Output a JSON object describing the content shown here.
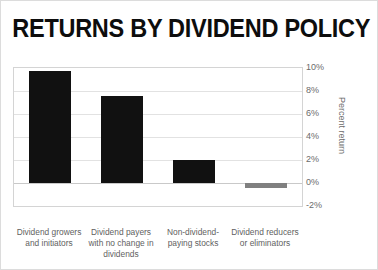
{
  "chart_data": {
    "type": "bar",
    "title": "RETURNS BY DIVIDEND POLICY",
    "xlabel": "",
    "ylabel": "Percent return",
    "categories": [
      "Dividend growers and initiators",
      "Dividend payers with no change in dividends",
      "Non-dividend-paying stocks",
      "Dividend reducers or eliminators"
    ],
    "values": [
      9.7,
      7.6,
      2.0,
      -0.4
    ],
    "value_labels": [
      "9.7%",
      "7.6%",
      "2.0%",
      "-0.4%"
    ],
    "bar_colors": [
      "#111111",
      "#111111",
      "#111111",
      "#808080"
    ],
    "ylim": [
      -2,
      10
    ],
    "yticks": [
      10,
      8,
      6,
      4,
      2,
      0,
      -2
    ],
    "ytick_labels": [
      "10%",
      "8%",
      "6%",
      "4%",
      "2%",
      "0%",
      "-2%"
    ],
    "grid": true,
    "grid_axis": "y",
    "legend": false,
    "legend_position": "none",
    "y_axis_side": "right"
  },
  "axis": {
    "y_title": "Percent return",
    "ticks": [
      {
        "label": "10%",
        "value": 10
      },
      {
        "label": "8%",
        "value": 8
      },
      {
        "label": "6%",
        "value": 6
      },
      {
        "label": "4%",
        "value": 4
      },
      {
        "label": "2%",
        "value": 2
      },
      {
        "label": "0%",
        "value": 0
      },
      {
        "label": "-2%",
        "value": -2
      }
    ]
  },
  "categories": [
    {
      "label": "Dividend growers and initiators"
    },
    {
      "label": "Dividend payers with no change in dividends"
    },
    {
      "label": "Non-dividend-paying stocks"
    },
    {
      "label": "Dividend reducers or eliminators"
    }
  ],
  "colors": {
    "bar_positive": "#111111",
    "bar_negative": "#808080",
    "gridline": "#e2e2e2",
    "axis_text": "#6b6b6b",
    "title_text": "#0d0d0d",
    "frame": "#d4d4d4"
  }
}
